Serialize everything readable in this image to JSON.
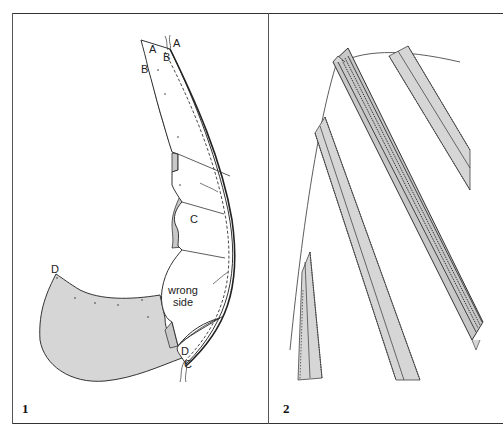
{
  "figure": {
    "panels": [
      {
        "number": "1",
        "labels": {
          "a_left": "A",
          "a_right": "A",
          "b_left": "B",
          "b_right": "B",
          "c_mid": "C",
          "c_bottom": "C",
          "d_left": "D",
          "d_bottom": "D",
          "wrong_side_line1": "wrong",
          "wrong_side_line2": "side"
        }
      },
      {
        "number": "2"
      }
    ],
    "colors": {
      "line": "#333333",
      "fabric_shade": "#d6d6d6",
      "fabric_white": "#ffffff",
      "background": "#ffffff"
    }
  }
}
